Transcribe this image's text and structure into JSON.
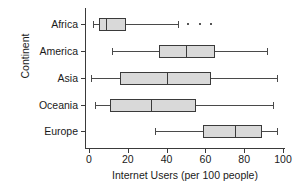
{
  "chart_data": {
    "type": "boxplot",
    "title": "",
    "xlabel": "Internet Users (per 100 people)",
    "ylabel": "Continent",
    "orientation": "horizontal",
    "xlim": [
      0,
      100
    ],
    "xticks": [
      0,
      20,
      40,
      60,
      80,
      100
    ],
    "xticklabels": [
      "0",
      "20",
      "40",
      "60",
      "80",
      "100"
    ],
    "categories": [
      "Africa",
      "America",
      "Asia",
      "Oceania",
      "Europe"
    ],
    "grid": false,
    "legend": null,
    "box_fill": "#d9d9d9",
    "line_color": "#3a3a3a",
    "boxes": [
      {
        "category": "Africa",
        "whisker_low": 2,
        "q1": 5,
        "median": 9,
        "q3": 19,
        "whisker_high": 46,
        "outliers": [
          51,
          57,
          63
        ]
      },
      {
        "category": "America",
        "whisker_low": 12,
        "q1": 36,
        "median": 50,
        "q3": 65,
        "whisker_high": 92,
        "outliers": []
      },
      {
        "category": "Asia",
        "whisker_low": 1,
        "q1": 16,
        "median": 40,
        "q3": 63,
        "whisker_high": 97,
        "outliers": []
      },
      {
        "category": "Oceania",
        "whisker_low": 3,
        "q1": 11,
        "median": 32,
        "q3": 55,
        "whisker_high": 95,
        "outliers": []
      },
      {
        "category": "Europe",
        "whisker_low": 34,
        "q1": 59,
        "median": 75,
        "q3": 89,
        "whisker_high": 97,
        "outliers": []
      }
    ]
  }
}
